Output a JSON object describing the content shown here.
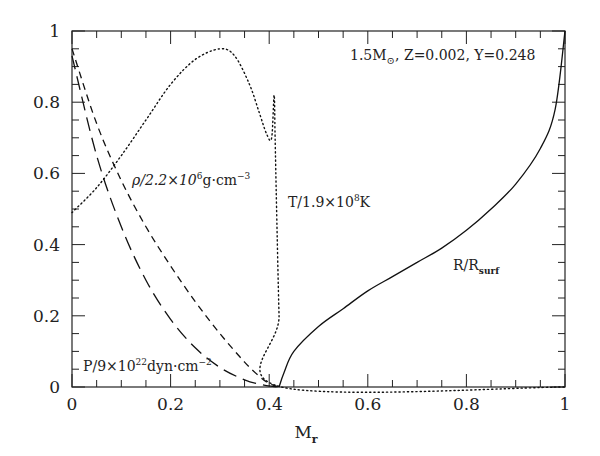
{
  "chart_data": {
    "type": "line",
    "title": "",
    "annotation": "1.5M⊙, Z=0.002, Y=0.248",
    "xlabel": "M_r",
    "ylabel": "",
    "xlim": [
      0,
      1
    ],
    "ylim": [
      0,
      1
    ],
    "xticks": [
      "0",
      "0.2",
      "0.4",
      "0.6",
      "0.8",
      "1"
    ],
    "yticks": [
      "0",
      "0.2",
      "0.4",
      "0.6",
      "0.8",
      "1"
    ],
    "grid": false,
    "legend": "inline labels",
    "series": [
      {
        "name": "T/1.9×10^8K",
        "style": "dotted",
        "x": [
          0.0,
          0.05,
          0.1,
          0.15,
          0.2,
          0.25,
          0.3,
          0.33,
          0.36,
          0.38,
          0.395,
          0.405,
          0.41,
          0.412,
          0.415,
          0.42,
          0.425,
          1.0
        ],
        "y": [
          0.49,
          0.56,
          0.65,
          0.75,
          0.85,
          0.92,
          0.95,
          0.93,
          0.85,
          0.77,
          0.71,
          0.7,
          0.82,
          0.7,
          0.5,
          0.2,
          0.0,
          0.0
        ]
      },
      {
        "name": "ρ/2.2×10^6g·cm^-3",
        "style": "short-dashed",
        "x": [
          0.0,
          0.05,
          0.1,
          0.15,
          0.2,
          0.25,
          0.3,
          0.35,
          0.38,
          0.4,
          0.42
        ],
        "y": [
          0.95,
          0.74,
          0.58,
          0.45,
          0.34,
          0.24,
          0.15,
          0.07,
          0.03,
          0.01,
          0.0
        ]
      },
      {
        "name": "P/9×10^22dyn·cm^-2",
        "style": "long-dashed",
        "x": [
          0.0,
          0.05,
          0.1,
          0.15,
          0.2,
          0.25,
          0.3,
          0.35,
          0.38,
          0.4,
          0.42
        ],
        "y": [
          0.93,
          0.65,
          0.45,
          0.3,
          0.19,
          0.11,
          0.055,
          0.02,
          0.008,
          0.003,
          0.0
        ]
      },
      {
        "name": "R/R_surf",
        "style": "solid",
        "x": [
          0.42,
          0.43,
          0.45,
          0.5,
          0.55,
          0.6,
          0.65,
          0.7,
          0.75,
          0.8,
          0.85,
          0.9,
          0.95,
          0.98,
          1.0
        ],
        "y": [
          0.0,
          0.04,
          0.1,
          0.17,
          0.22,
          0.27,
          0.31,
          0.35,
          0.39,
          0.44,
          0.5,
          0.57,
          0.67,
          0.78,
          1.0
        ]
      }
    ]
  },
  "labels": {
    "title_main": "1.5M",
    "title_sub": "⊙",
    "title_rest": ", Z=0.002, Y=0.248",
    "rho_pre": "ρ/2.2×10",
    "rho_exp": "6",
    "rho_post": "g·cm",
    "rho_exp2": "−3",
    "t_pre": "T/1.9×10",
    "t_exp": "8",
    "t_post": "K",
    "p_pre": "P/9×10",
    "p_exp": "22",
    "p_post": "dyn·cm",
    "p_exp2": "−2",
    "r_pre": "R/R",
    "r_sub": "surf",
    "x_main": "M",
    "x_sub": "r"
  }
}
